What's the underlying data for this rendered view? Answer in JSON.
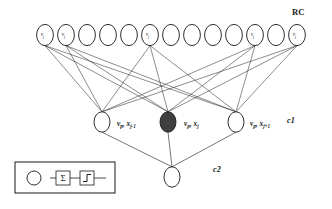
{
  "figure": {
    "type": "neural-network-diagram",
    "title": "",
    "background_color": "#ffffff",
    "stroke_color": "#1a1a1a",
    "filled_node_color": "#3f3f3f"
  },
  "labels": {
    "rc": "RC",
    "c1": "c1",
    "c2": "c2"
  },
  "top_layer": {
    "name": "RC layer",
    "count": 13,
    "node_label": "v",
    "node_subscript": "j",
    "labeled_indices": [
      0,
      1,
      5,
      10,
      12
    ],
    "nodes": [
      {
        "index": 0,
        "x": 45,
        "y": 35,
        "label": "v",
        "sub": "j",
        "labeled": true
      },
      {
        "index": 1,
        "x": 66,
        "y": 35,
        "label": "v",
        "sub": "j",
        "labeled": true
      },
      {
        "index": 2,
        "x": 87,
        "y": 35,
        "label": "",
        "sub": "",
        "labeled": false
      },
      {
        "index": 3,
        "x": 108,
        "y": 35,
        "label": "",
        "sub": "",
        "labeled": false
      },
      {
        "index": 4,
        "x": 129,
        "y": 35,
        "label": "",
        "sub": "",
        "labeled": false
      },
      {
        "index": 5,
        "x": 150,
        "y": 35,
        "label": "v",
        "sub": "j",
        "labeled": true
      },
      {
        "index": 6,
        "x": 171,
        "y": 35,
        "label": "",
        "sub": "",
        "labeled": false
      },
      {
        "index": 7,
        "x": 192,
        "y": 35,
        "label": "",
        "sub": "",
        "labeled": false
      },
      {
        "index": 8,
        "x": 213,
        "y": 35,
        "label": "",
        "sub": "",
        "labeled": false
      },
      {
        "index": 9,
        "x": 234,
        "y": 35,
        "label": "",
        "sub": "",
        "labeled": false
      },
      {
        "index": 10,
        "x": 255,
        "y": 35,
        "label": "v",
        "sub": "j",
        "labeled": true
      },
      {
        "index": 11,
        "x": 276,
        "y": 35,
        "label": "",
        "sub": "",
        "labeled": false
      },
      {
        "index": 12,
        "x": 297,
        "y": 35,
        "label": "v",
        "sub": "j",
        "labeled": true
      }
    ]
  },
  "middle_layer": {
    "name": "c1 layer",
    "count": 3,
    "nodes": [
      {
        "index": 0,
        "x": 102,
        "y": 122,
        "filled": false,
        "label_main": "v",
        "label_sub1": "p",
        "label_mid": ", x",
        "label_sub2": "j-1",
        "label_x": 117,
        "label_y": 120
      },
      {
        "index": 1,
        "x": 168,
        "y": 122,
        "filled": true,
        "label_main": "v",
        "label_sub1": "p",
        "label_mid": ", x",
        "label_sub2": "j",
        "label_x": 184,
        "label_y": 120
      },
      {
        "index": 2,
        "x": 236,
        "y": 122,
        "filled": false,
        "label_main": "v",
        "label_sub1": "p",
        "label_mid": ", x",
        "label_sub2": "j+1",
        "label_x": 250,
        "label_y": 120
      }
    ]
  },
  "bottom_layer": {
    "name": "c2 layer",
    "count": 1,
    "nodes": [
      {
        "index": 0,
        "x": 172,
        "y": 177,
        "filled": false
      }
    ]
  },
  "legend": {
    "box": {
      "x": 15,
      "y": 162,
      "width": 100,
      "height": 31
    },
    "items": [
      {
        "kind": "circle-icon",
        "name": "neuron-circle",
        "cx": 34,
        "cy": 178,
        "r": 7
      },
      {
        "kind": "sum-icon",
        "name": "summation-box",
        "x": 56,
        "y": 171,
        "width": 14,
        "height": 14,
        "glyph": "Σ"
      },
      {
        "kind": "step-icon",
        "name": "activation-step-box",
        "x": 80,
        "y": 171,
        "width": 14,
        "height": 14,
        "glyph": "step"
      }
    ]
  },
  "edges": {
    "description": "Each labeled top node connects to all three middle nodes; each middle node connects to the bottom node.",
    "source_indices": [
      0,
      1,
      5,
      10,
      12
    ],
    "target_indices": [
      0,
      1,
      2
    ]
  }
}
